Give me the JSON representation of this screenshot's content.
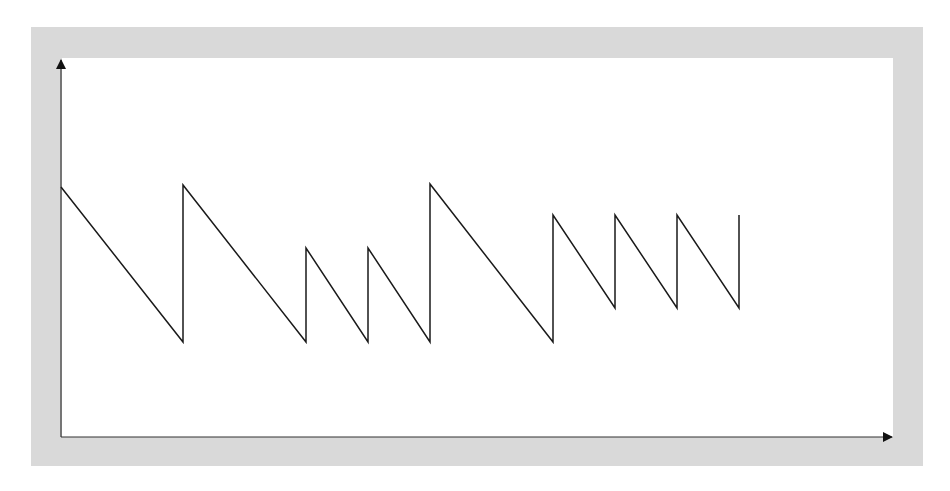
{
  "diagram": {
    "type": "sawtooth-waveform",
    "frame_color": "#d9d9d9",
    "background_color": "#ffffff",
    "line_color": "#1a1a1a",
    "axes": {
      "origin": [
        61,
        437
      ],
      "y_axis_top": [
        61,
        60
      ],
      "x_axis_end": [
        892,
        437
      ],
      "x_label": "",
      "y_label": ""
    },
    "waveform_points": [
      [
        61,
        187
      ],
      [
        183,
        342
      ],
      [
        183,
        185
      ],
      [
        306,
        342
      ],
      [
        306,
        248
      ],
      [
        368,
        342
      ],
      [
        368,
        248
      ],
      [
        430,
        342
      ],
      [
        430,
        184
      ],
      [
        553,
        342
      ],
      [
        553,
        215
      ],
      [
        615,
        308
      ],
      [
        615,
        215
      ],
      [
        677,
        308
      ],
      [
        677,
        215
      ],
      [
        739,
        308
      ],
      [
        739,
        215
      ]
    ]
  }
}
